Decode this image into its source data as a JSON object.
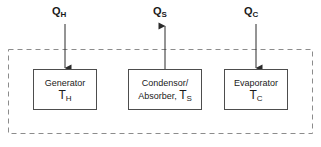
{
  "diagram": {
    "boundary": {
      "name": "system-boundary",
      "style": "dashed",
      "color": "#8c8c8c"
    },
    "heat_flows": [
      {
        "id": "q-h",
        "symbol": "Q",
        "subscript": "H",
        "direction": "in",
        "arrow": "down",
        "target": "generator"
      },
      {
        "id": "q-s",
        "symbol": "Q",
        "subscript": "S",
        "direction": "out",
        "arrow": "up",
        "target": "condensor-absorber"
      },
      {
        "id": "q-c",
        "symbol": "Q",
        "subscript": "C",
        "direction": "in",
        "arrow": "down",
        "target": "evaporator"
      }
    ],
    "units": [
      {
        "id": "generator",
        "lines": [
          "Generator"
        ],
        "temp_symbol": "T",
        "temp_subscript": "H",
        "temp_inline": false
      },
      {
        "id": "condensor-absorber",
        "lines": [
          "Condensor/",
          "Absorber, "
        ],
        "temp_symbol": "T",
        "temp_subscript": "S",
        "temp_inline": true
      },
      {
        "id": "evaporator",
        "lines": [
          "Evaporator"
        ],
        "temp_symbol": "T",
        "temp_subscript": "C",
        "temp_inline": false
      }
    ]
  },
  "colors": {
    "box_border": "#4d4d4d",
    "boundary": "#8c8c8c",
    "arrow": "#2b2b2b",
    "text": "#1a1a1a",
    "background": "#ffffff"
  }
}
